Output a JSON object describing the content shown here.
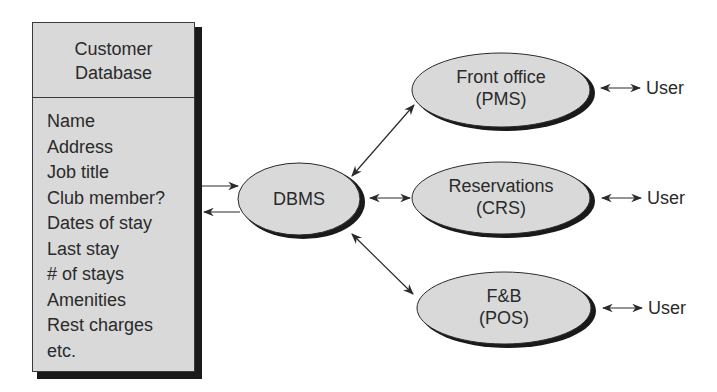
{
  "customer_database": {
    "title_line1": "Customer",
    "title_line2": "Database",
    "fields": [
      "Name",
      "Address",
      "Job title",
      "Club member?",
      "Dates of stay",
      "Last stay",
      "# of stays",
      "Amenities",
      "Rest charges",
      "etc."
    ]
  },
  "dbms": {
    "label": "DBMS"
  },
  "systems": [
    {
      "line1": "Front office",
      "line2": "(PMS)",
      "user": "User"
    },
    {
      "line1": "Reservations",
      "line2": "(CRS)",
      "user": "User"
    },
    {
      "line1": "F&B",
      "line2": "(POS)",
      "user": "User"
    }
  ],
  "colors": {
    "fill": "#d9d9d9",
    "stroke": "#2a2a2a",
    "shadow": "#1a1a1a"
  }
}
